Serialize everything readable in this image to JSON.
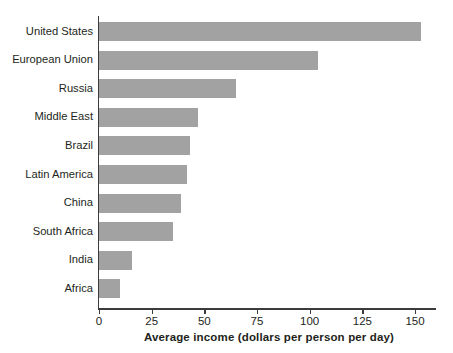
{
  "chart_data": {
    "type": "bar",
    "orientation": "horizontal",
    "title": "",
    "xlabel": "Average income (dollars per person per day)",
    "ylabel": "",
    "categories": [
      "United States",
      "European Union",
      "Russia",
      "Middle East",
      "Brazil",
      "Latin America",
      "China",
      "South Africa",
      "India",
      "Africa"
    ],
    "values": [
      153,
      104,
      65,
      47,
      43,
      42,
      39,
      35,
      15.5,
      10
    ],
    "xlim": [
      0,
      150
    ],
    "xticks": [
      0,
      25,
      50,
      75,
      100,
      125,
      150
    ],
    "xtick_labels": [
      "0",
      "25",
      "50",
      "75",
      "100",
      "125",
      "150"
    ],
    "grid": false,
    "legend": null,
    "bar_color": "#a2a2a2",
    "axis_color": "#3b3b3b",
    "background_color": "#ffffff"
  }
}
